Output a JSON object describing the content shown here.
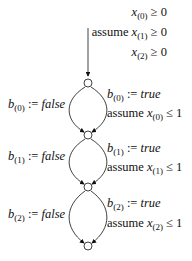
{
  "diagram": {
    "type": "automaton",
    "initial_labels": [
      {
        "prefix": "",
        "var": "x",
        "idx": "(0)",
        "op": "≥ 0"
      },
      {
        "prefix": "assume ",
        "var": "x",
        "idx": "(1)",
        "op": "≥ 0"
      },
      {
        "prefix": "",
        "var": "x",
        "idx": "(2)",
        "op": "≥ 0"
      }
    ],
    "nodes": [
      {
        "id": "q0",
        "x": 88,
        "y": 83
      },
      {
        "id": "q1",
        "x": 88,
        "y": 135
      },
      {
        "id": "q2",
        "x": 88,
        "y": 187
      },
      {
        "id": "q3",
        "x": 88,
        "y": 246
      }
    ],
    "edges": [
      {
        "from": "q0",
        "to": "q1",
        "left": {
          "var": "b",
          "idx": "(0)",
          "assign": ":= ",
          "val": "false"
        },
        "right1": {
          "var": "b",
          "idx": "(0)",
          "assign": ":= ",
          "val": "true"
        },
        "right2": {
          "prefix": "assume ",
          "var": "x",
          "idx": "(0)",
          "op": "≤ 1"
        }
      },
      {
        "from": "q1",
        "to": "q2",
        "left": {
          "var": "b",
          "idx": "(1)",
          "assign": ":= ",
          "val": "false"
        },
        "right1": {
          "var": "b",
          "idx": "(1)",
          "assign": ":= ",
          "val": "true"
        },
        "right2": {
          "prefix": "assume ",
          "var": "x",
          "idx": "(1)",
          "op": "≤ 1"
        }
      },
      {
        "from": "q2",
        "to": "q3",
        "left": {
          "var": "b",
          "idx": "(2)",
          "assign": ":= ",
          "val": "false"
        },
        "right1": {
          "var": "b",
          "idx": "(2)",
          "assign": ":= ",
          "val": "true"
        },
        "right2": {
          "prefix": "assume ",
          "var": "x",
          "idx": "(2)",
          "op": "≤ 1"
        }
      }
    ]
  }
}
